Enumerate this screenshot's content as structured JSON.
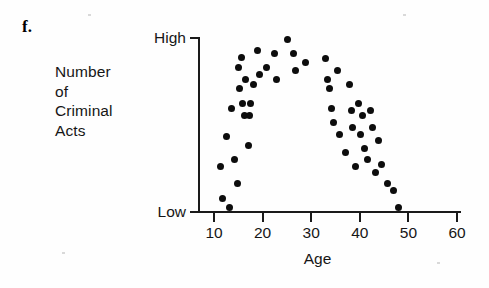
{
  "figure": {
    "panel_label": "f.",
    "y_axis_title_lines": [
      "Number",
      "of",
      "Criminal",
      "Acts"
    ],
    "x_axis_title": "Age"
  },
  "chart_data": {
    "type": "scatter",
    "title": "",
    "xlabel": "Age",
    "ylabel": "Number of Criminal Acts",
    "xlim": [
      5,
      62
    ],
    "ylim": [
      0,
      100
    ],
    "xticks": [
      10,
      20,
      30,
      40,
      50,
      60
    ],
    "xticklabels": [
      "10",
      "20",
      "30",
      "40",
      "50",
      "60"
    ],
    "yticks": [
      0,
      100
    ],
    "yticklabels": [
      "Low",
      "High"
    ],
    "grid": false,
    "legend": null,
    "relationship": "curvilinear (inverted-U): criminal acts rise through the teens, peak in the mid-20s, then decline steadily to near zero by the late 40s",
    "points": [
      {
        "age": 11.4,
        "acts": 26
      },
      {
        "age": 11.8,
        "acts": 7
      },
      {
        "age": 12.6,
        "acts": 43
      },
      {
        "age": 13.1,
        "acts": 2
      },
      {
        "age": 13.6,
        "acts": 59
      },
      {
        "age": 14.3,
        "acts": 30
      },
      {
        "age": 14.8,
        "acts": 16
      },
      {
        "age": 15.0,
        "acts": 83
      },
      {
        "age": 15.2,
        "acts": 71
      },
      {
        "age": 15.6,
        "acts": 89
      },
      {
        "age": 15.9,
        "acts": 62
      },
      {
        "age": 16.2,
        "acts": 55
      },
      {
        "age": 16.5,
        "acts": 76
      },
      {
        "age": 17.0,
        "acts": 38
      },
      {
        "age": 17.3,
        "acts": 55
      },
      {
        "age": 17.6,
        "acts": 62
      },
      {
        "age": 18.2,
        "acts": 73
      },
      {
        "age": 19.0,
        "acts": 93
      },
      {
        "age": 19.4,
        "acts": 79
      },
      {
        "age": 20.9,
        "acts": 83
      },
      {
        "age": 22.4,
        "acts": 91
      },
      {
        "age": 22.8,
        "acts": 76
      },
      {
        "age": 25.1,
        "acts": 99
      },
      {
        "age": 26.4,
        "acts": 91
      },
      {
        "age": 26.8,
        "acts": 81
      },
      {
        "age": 28.8,
        "acts": 86
      },
      {
        "age": 32.9,
        "acts": 88
      },
      {
        "age": 33.3,
        "acts": 76
      },
      {
        "age": 33.7,
        "acts": 71
      },
      {
        "age": 34.2,
        "acts": 59
      },
      {
        "age": 34.6,
        "acts": 51
      },
      {
        "age": 35.4,
        "acts": 81
      },
      {
        "age": 35.8,
        "acts": 44
      },
      {
        "age": 37.0,
        "acts": 34
      },
      {
        "age": 37.9,
        "acts": 73
      },
      {
        "age": 38.2,
        "acts": 58
      },
      {
        "age": 38.6,
        "acts": 48
      },
      {
        "age": 39.1,
        "acts": 26
      },
      {
        "age": 39.8,
        "acts": 62
      },
      {
        "age": 40.2,
        "acts": 44
      },
      {
        "age": 40.6,
        "acts": 55
      },
      {
        "age": 41.0,
        "acts": 36
      },
      {
        "age": 41.6,
        "acts": 30
      },
      {
        "age": 42.2,
        "acts": 58
      },
      {
        "age": 42.6,
        "acts": 48
      },
      {
        "age": 43.3,
        "acts": 22
      },
      {
        "age": 43.8,
        "acts": 41
      },
      {
        "age": 44.4,
        "acts": 27
      },
      {
        "age": 45.6,
        "acts": 16
      },
      {
        "age": 46.9,
        "acts": 12
      },
      {
        "age": 47.9,
        "acts": 2
      }
    ]
  }
}
